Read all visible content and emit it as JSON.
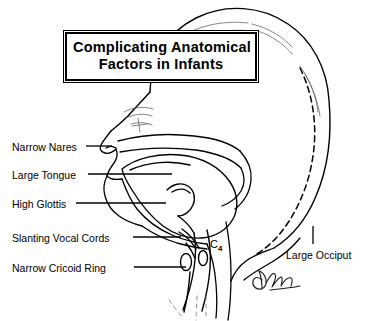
{
  "figure": {
    "title_lines": [
      "Complicating Anatomical",
      "Factors in Infants"
    ],
    "background_color": "#ffffff",
    "ink_color": "#000000"
  },
  "labels": {
    "left": [
      {
        "id": "narrow-nares",
        "text": "Narrow Nares",
        "x": 12,
        "y": 141
      },
      {
        "id": "large-tongue",
        "text": "Large Tongue",
        "x": 12,
        "y": 169
      },
      {
        "id": "high-glottis",
        "text": "High Glottis",
        "x": 12,
        "y": 198
      },
      {
        "id": "slanting-vocal-cords",
        "text": "Slanting Vocal Cords",
        "x": 12,
        "y": 232
      },
      {
        "id": "narrow-cricoid-ring",
        "text": "Narrow Cricoid Ring",
        "x": 12,
        "y": 262
      }
    ],
    "right": [
      {
        "id": "large-occiput",
        "text": "Large Occiput",
        "x": 286,
        "y": 249
      }
    ],
    "vertebra": {
      "id": "c4",
      "text": "C",
      "subscript": "4",
      "x": 210,
      "y": 238
    }
  },
  "annotations": {
    "signature": "artist-signature"
  },
  "icons": {
    "leader_line": "leader-line",
    "skull_outline": "skull-outline-icon",
    "dashed_inner_skull": "dashed-skull-line-icon"
  }
}
